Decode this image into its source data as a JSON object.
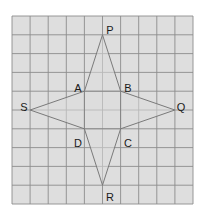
{
  "diagram": {
    "type": "four-pointed star on square grid",
    "grid": {
      "columns": 10,
      "rows": 10,
      "origin_px": [
        12,
        16
      ],
      "cell_w": 18.1,
      "cell_h": 18.8,
      "background_color": "#dedede",
      "line_color": "#8c8c8c"
    },
    "star": {
      "fill_color": "#dcdcdc",
      "stroke_color": "#7a7a7a",
      "outline_order": [
        "P",
        "B",
        "Q",
        "C",
        "R",
        "D",
        "S",
        "A"
      ]
    },
    "inner_square": [
      "A",
      "B",
      "C",
      "D"
    ],
    "vertices": [
      {
        "name": "P",
        "grid": [
          5,
          1
        ],
        "label": "P",
        "label_px": [
          110,
          30
        ]
      },
      {
        "name": "A",
        "grid": [
          4,
          4
        ],
        "label": "A",
        "label_px": [
          78,
          88
        ]
      },
      {
        "name": "B",
        "grid": [
          6,
          4
        ],
        "label": "B",
        "label_px": [
          128,
          88
        ]
      },
      {
        "name": "S",
        "grid": [
          1,
          5
        ],
        "label": "S",
        "label_px": [
          24,
          107
        ]
      },
      {
        "name": "Q",
        "grid": [
          9,
          5
        ],
        "label": "Q",
        "label_px": [
          181,
          107
        ]
      },
      {
        "name": "D",
        "grid": [
          4,
          6
        ],
        "label": "D",
        "label_px": [
          78,
          143
        ]
      },
      {
        "name": "C",
        "grid": [
          6,
          6
        ],
        "label": "C",
        "label_px": [
          128,
          143
        ]
      },
      {
        "name": "R",
        "grid": [
          5,
          9
        ],
        "label": "R",
        "label_px": [
          110,
          197
        ]
      }
    ]
  }
}
